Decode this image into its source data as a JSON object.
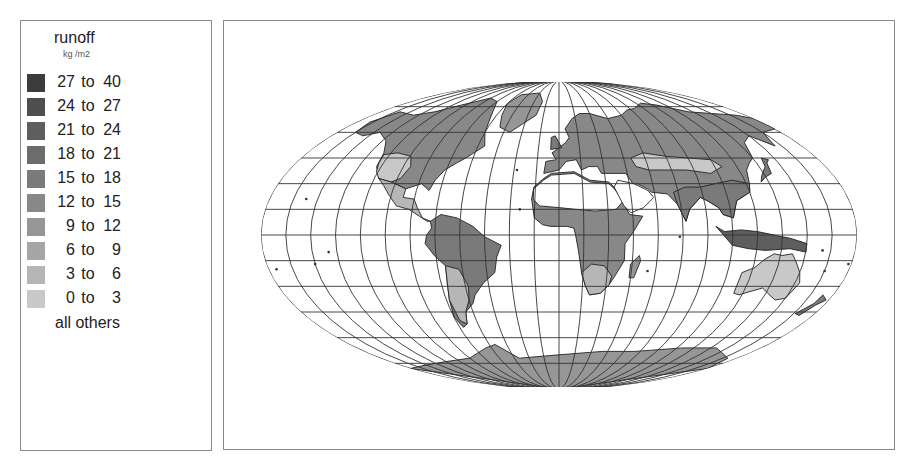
{
  "legend": {
    "title": "runoff",
    "unit": "kg /m2",
    "items": [
      {
        "lo": "27",
        "to": "to",
        "hi": "40",
        "color": "#3c3c3c"
      },
      {
        "lo": "24",
        "to": "to",
        "hi": "27",
        "color": "#4e4e4e"
      },
      {
        "lo": "21",
        "to": "to",
        "hi": "24",
        "color": "#5e5e5e"
      },
      {
        "lo": "18",
        "to": "to",
        "hi": "21",
        "color": "#6c6c6c"
      },
      {
        "lo": "15",
        "to": "to",
        "hi": "18",
        "color": "#7a7a7a"
      },
      {
        "lo": "12",
        "to": "to",
        "hi": "15",
        "color": "#888888"
      },
      {
        "lo": "9",
        "to": "to",
        "hi": "12",
        "color": "#969696"
      },
      {
        "lo": "6",
        "to": "to",
        "hi": "9",
        "color": "#a6a6a6"
      },
      {
        "lo": "3",
        "to": "to",
        "hi": "6",
        "color": "#b6b6b6"
      },
      {
        "lo": "0",
        "to": "to",
        "hi": "3",
        "color": "#c8c8c8"
      }
    ],
    "other_label": "all others"
  },
  "chart_data": {
    "type": "heatmap",
    "title": "runoff",
    "subtitle": "kg /m2",
    "projection": "Mollweide-like world map with 15-degree graticule",
    "legend_position": "left",
    "legend": [
      {
        "range": "27 to 40",
        "min": 27,
        "max": 40,
        "color": "#3c3c3c"
      },
      {
        "range": "24 to 27",
        "min": 24,
        "max": 27,
        "color": "#4e4e4e"
      },
      {
        "range": "21 to 24",
        "min": 21,
        "max": 24,
        "color": "#5e5e5e"
      },
      {
        "range": "18 to 21",
        "min": 18,
        "max": 21,
        "color": "#6c6c6c"
      },
      {
        "range": "15 to 18",
        "min": 15,
        "max": 18,
        "color": "#7a7a7a"
      },
      {
        "range": "12 to 15",
        "min": 12,
        "max": 15,
        "color": "#888888"
      },
      {
        "range": "9 to 12",
        "min": 9,
        "max": 12,
        "color": "#969696"
      },
      {
        "range": "6 to 9",
        "min": 6,
        "max": 9,
        "color": "#a6a6a6"
      },
      {
        "range": "3 to 6",
        "min": 3,
        "max": 6,
        "color": "#b6b6b6"
      },
      {
        "range": "0 to 3",
        "min": 0,
        "max": 3,
        "color": "#c8c8c8"
      },
      {
        "range": "all others",
        "color": "#ffffff"
      }
    ],
    "regions": [
      {
        "name": "North America (Canada/Alaska)",
        "class": "12 to 15"
      },
      {
        "name": "Western USA",
        "class": "0 to 3"
      },
      {
        "name": "Eastern USA",
        "class": "9 to 12"
      },
      {
        "name": "Mexico / Central America",
        "class": "3 to 6"
      },
      {
        "name": "Greenland",
        "class": "9 to 12"
      },
      {
        "name": "South America (Amazon)",
        "class": "15 to 18"
      },
      {
        "name": "Southern South America",
        "class": "3 to 6"
      },
      {
        "name": "Europe",
        "class": "12 to 15"
      },
      {
        "name": "Sahara / Arabia",
        "class": "all others"
      },
      {
        "name": "Central Africa",
        "class": "12 to 15"
      },
      {
        "name": "Southern Africa",
        "class": "3 to 6"
      },
      {
        "name": "Siberia / Northern Asia",
        "class": "12 to 15"
      },
      {
        "name": "South & East Asia",
        "class": "15 to 18"
      },
      {
        "name": "Central Asia",
        "class": "0 to 3"
      },
      {
        "name": "Southeast Asia / Indonesia",
        "class": "21 to 24"
      },
      {
        "name": "Australia",
        "class": "0 to 3"
      },
      {
        "name": "Antarctica",
        "class": "9 to 12"
      }
    ],
    "graticule_step_deg": 15,
    "grid": true
  },
  "map": {
    "cx": 335,
    "cy": 214,
    "rx": 298,
    "ry": 154,
    "top_clip": 61,
    "bottom_clip": 366,
    "graticule_color": "#333333",
    "border_color": "#222222"
  }
}
